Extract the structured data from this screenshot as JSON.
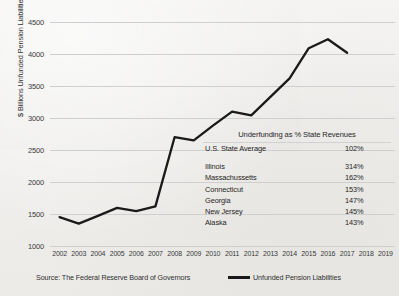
{
  "chart_data": {
    "type": "line",
    "title": "",
    "xlabel": "",
    "ylabel": "$ Billions Unfunded Pension Liabilities",
    "ylim": [
      1000,
      4500
    ],
    "yticks": [
      1000,
      1500,
      2000,
      2500,
      3000,
      3500,
      4000,
      4500
    ],
    "grid": true,
    "legend_position": "bottom-right",
    "categories": [
      2002,
      2003,
      2004,
      2005,
      2006,
      2007,
      2008,
      2009,
      2010,
      2011,
      2012,
      2013,
      2014,
      2015,
      2016,
      2017,
      2018,
      2019
    ],
    "xtick_labels": [
      "2002",
      "2003",
      "2004",
      "2005",
      "2006",
      "2007",
      "2008",
      "2009",
      "2010",
      "2011",
      "2012",
      "2013",
      "2014",
      "2015",
      "2016",
      "2017",
      "2018",
      "2019"
    ],
    "series": [
      {
        "name": "Unfunded Pension Liabilities",
        "color": "#1a1a1a",
        "x": [
          2002,
          2003,
          2004,
          2005,
          2006,
          2007,
          2008,
          2009,
          2010,
          2011,
          2012,
          2013,
          2014,
          2015,
          2016,
          2017
        ],
        "values": [
          1450,
          1350,
          1470,
          1595,
          1545,
          1620,
          2700,
          2650,
          2880,
          3100,
          3040,
          3330,
          3620,
          4090,
          4230,
          4020
        ]
      }
    ]
  },
  "yaxis": {
    "title": "$ Billions Unfunded Pension Liabilities",
    "ticks": [
      "4500",
      "4000",
      "3500",
      "3000",
      "2500",
      "2000",
      "1500",
      "1000"
    ]
  },
  "table": {
    "title": "Underfunding as % State Revenues",
    "average_row": {
      "label": "U.S. State Average",
      "value": "102%"
    },
    "rows": [
      {
        "label": "Illinois",
        "value": "314%"
      },
      {
        "label": "Massachussetts",
        "value": "162%"
      },
      {
        "label": "Connecticut",
        "value": "153%"
      },
      {
        "label": "Georgia",
        "value": "147%"
      },
      {
        "label": "New Jersey",
        "value": "145%"
      },
      {
        "label": "Alaska",
        "value": "143%"
      }
    ]
  },
  "footer": {
    "source": "Source:  The Federal Reserve Board of Governors",
    "legend_label": "Unfunded Pension Liabilities"
  }
}
